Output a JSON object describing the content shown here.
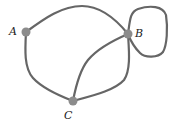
{
  "diagram": {
    "type": "graph",
    "nodes": [
      {
        "id": "A",
        "label": "A",
        "x": 26,
        "y": 32,
        "label_x": 9,
        "label_y": 35
      },
      {
        "id": "B",
        "label": "B",
        "x": 128,
        "y": 34,
        "label_x": 135,
        "label_y": 37
      },
      {
        "id": "C",
        "label": "C",
        "x": 73,
        "y": 101,
        "label_x": 64,
        "label_y": 119
      }
    ],
    "edges": [
      {
        "from": "A",
        "to": "B",
        "kind": "curve-top"
      },
      {
        "from": "A",
        "to": "C",
        "kind": "curve-left"
      },
      {
        "from": "C",
        "to": "B",
        "kind": "curve-inner"
      },
      {
        "from": "C",
        "to": "B",
        "kind": "curve-outer"
      },
      {
        "from": "B",
        "to": "B",
        "kind": "loop"
      }
    ],
    "colors": {
      "edge": "#666666",
      "node": "#8c8c8c",
      "label": "#222222"
    }
  }
}
